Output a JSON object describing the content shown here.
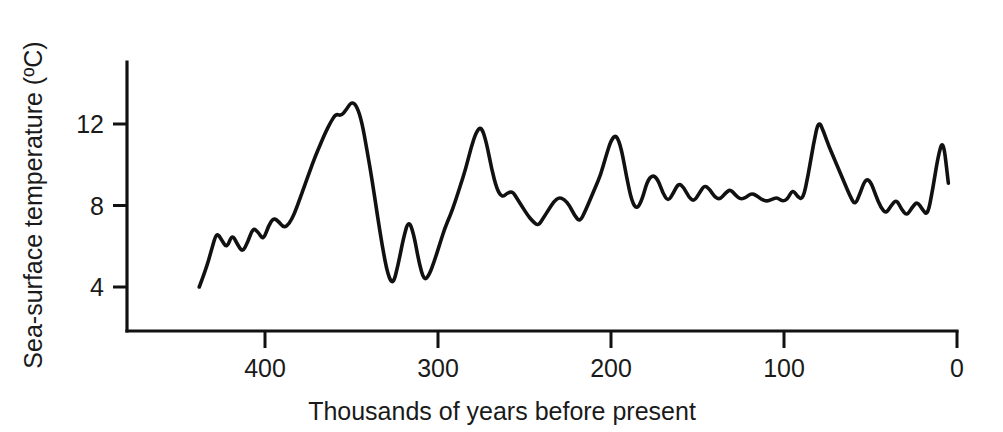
{
  "chart_data": {
    "type": "line",
    "title": "",
    "xlabel": "Thousands of years before present",
    "ylabel": "Sea-surface temperature (ºC)",
    "xlim": [
      440,
      0
    ],
    "ylim": [
      2.6,
      13.8
    ],
    "x_ticks": [
      400,
      300,
      200,
      100,
      0
    ],
    "x_tick_labels": [
      "400",
      "300",
      "200",
      "100",
      "0"
    ],
    "y_ticks": [
      4,
      8,
      12
    ],
    "y_tick_labels": [
      "4",
      "8",
      "12"
    ],
    "grid": false,
    "legend": "none",
    "x_axis_direction": "reversed",
    "line_color": "#111111",
    "background_color": "#ffffff",
    "series": [
      {
        "name": "Sea-surface temperature",
        "units": "ºC",
        "x": [
          438,
          434,
          431,
          428,
          425,
          422,
          419,
          416,
          413,
          410,
          407,
          404,
          401,
          398,
          395,
          392,
          389,
          386,
          383,
          380,
          377,
          374,
          371,
          368,
          365,
          362,
          359,
          356,
          353,
          350,
          347,
          344,
          341,
          338,
          335,
          332,
          329,
          326,
          323,
          320,
          317,
          314,
          311,
          308,
          305,
          302,
          299,
          296,
          293,
          290,
          287,
          284,
          281,
          278,
          275,
          272,
          269,
          266,
          263,
          260,
          257,
          254,
          251,
          248,
          245,
          242,
          239,
          236,
          233,
          230,
          227,
          224,
          221,
          218,
          215,
          212,
          209,
          206,
          203,
          200,
          197,
          194,
          191,
          188,
          185,
          182,
          179,
          176,
          173,
          170,
          167,
          164,
          161,
          158,
          155,
          152,
          149,
          146,
          143,
          140,
          137,
          134,
          131,
          128,
          125,
          122,
          119,
          116,
          113,
          110,
          107,
          104,
          101,
          98,
          95,
          92,
          89,
          86,
          83,
          80,
          77,
          74,
          71,
          68,
          65,
          62,
          59,
          56,
          53,
          50,
          47,
          44,
          41,
          38,
          35,
          32,
          29,
          26,
          23,
          20,
          17,
          14,
          11,
          8,
          5
        ],
        "y": [
          4.0,
          4.9,
          5.8,
          6.7,
          6.3,
          5.9,
          6.6,
          6.1,
          5.7,
          6.2,
          6.9,
          6.7,
          6.3,
          7.0,
          7.4,
          7.2,
          6.9,
          7.1,
          7.6,
          8.3,
          9.0,
          9.7,
          10.4,
          11.0,
          11.6,
          12.1,
          12.5,
          12.4,
          12.7,
          13.1,
          12.9,
          12.1,
          10.7,
          9.2,
          7.5,
          5.9,
          4.6,
          4.1,
          5.1,
          6.4,
          7.3,
          6.6,
          5.2,
          4.3,
          4.6,
          5.3,
          6.1,
          6.9,
          7.5,
          8.2,
          9.0,
          9.8,
          10.8,
          11.6,
          11.9,
          11.1,
          9.8,
          8.8,
          8.4,
          8.6,
          8.7,
          8.3,
          7.9,
          7.5,
          7.2,
          7.0,
          7.4,
          7.8,
          8.2,
          8.4,
          8.3,
          8.0,
          7.5,
          7.2,
          7.7,
          8.3,
          8.9,
          9.5,
          10.4,
          11.2,
          11.5,
          10.8,
          9.4,
          8.2,
          7.8,
          8.3,
          9.2,
          9.5,
          9.3,
          8.6,
          8.2,
          8.6,
          9.1,
          8.9,
          8.4,
          8.2,
          8.6,
          9.0,
          8.8,
          8.4,
          8.3,
          8.6,
          8.8,
          8.5,
          8.3,
          8.4,
          8.6,
          8.5,
          8.3,
          8.2,
          8.3,
          8.4,
          8.2,
          8.3,
          8.8,
          8.4,
          8.3,
          9.5,
          11.0,
          12.2,
          11.6,
          10.9,
          10.3,
          9.7,
          9.1,
          8.5,
          8.0,
          8.6,
          9.3,
          9.2,
          8.5,
          7.9,
          7.6,
          8.0,
          8.3,
          7.8,
          7.5,
          7.9,
          8.2,
          7.8,
          7.5,
          8.8,
          10.4,
          11.3,
          9.1
        ]
      }
    ],
    "annotations": []
  },
  "axes": {
    "x_title": "Thousands of years before present",
    "y_title": "Sea-surface temperature (ºC)",
    "x_tick_labels": [
      "400",
      "300",
      "200",
      "100",
      "0"
    ],
    "y_tick_labels": [
      "12",
      "8",
      "4"
    ]
  }
}
